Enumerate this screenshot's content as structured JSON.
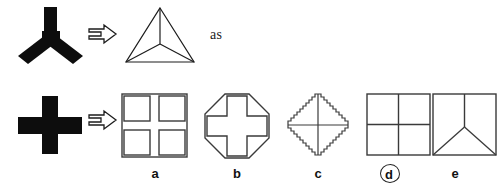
{
  "puzzle": {
    "type": "visual-analogy-multiple-choice",
    "relation_word": "as",
    "arrow_glyph": "⇒",
    "top_row": {
      "prompt_shape": {
        "name": "bold-y-shape",
        "description": "thick black Y with vertical upper stem and two lower diagonal arms"
      },
      "answer_shape": {
        "name": "tetrahedron-triangle",
        "description": "outline triangle with center point joined to all three vertices"
      }
    },
    "bottom_row": {
      "prompt_shape": {
        "name": "bold-plus-shape",
        "description": "thick black plus / cross"
      }
    },
    "options": [
      {
        "id": "a",
        "label": "a",
        "shape_name": "square-with-four-subsquares",
        "selected": false
      },
      {
        "id": "b",
        "label": "b",
        "shape_name": "octagon-with-outlined-cross",
        "selected": false
      },
      {
        "id": "c",
        "label": "c",
        "shape_name": "jagged-diamond-with-thin-cross",
        "selected": false
      },
      {
        "id": "d",
        "label": "d",
        "shape_name": "square-divided-into-quadrants",
        "selected": true
      },
      {
        "id": "e",
        "label": "e",
        "shape_name": "square-with-inscribed-y",
        "selected": false
      }
    ],
    "selected_option": "d"
  },
  "colors": {
    "background": "#ffffff",
    "ink": "#111111",
    "outline": "#3a3a3a"
  }
}
